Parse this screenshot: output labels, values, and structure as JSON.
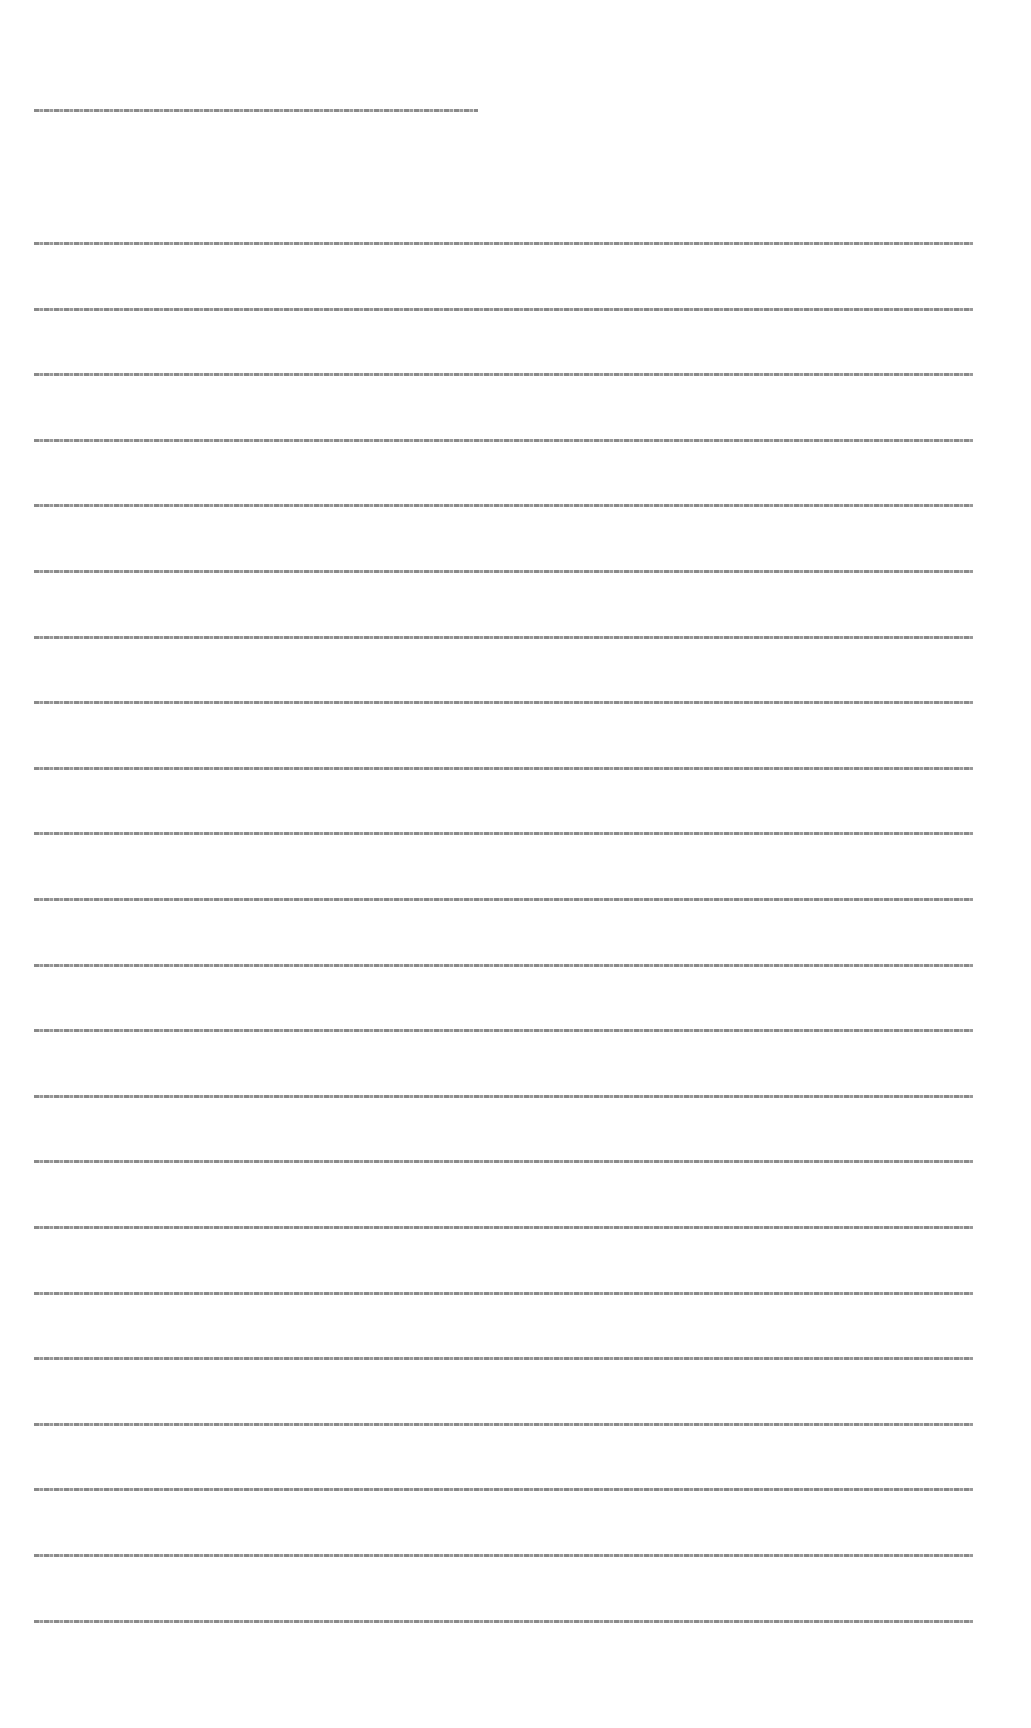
{
  "document": {
    "legibility_note": "Text is rendered too small to be legible in the screenshot; content not transcribable.",
    "header_line": "",
    "body_lines": [
      "",
      "",
      "",
      "",
      "",
      "",
      "",
      "",
      "",
      "",
      "",
      "",
      "",
      "",
      "",
      "",
      "",
      "",
      "",
      "",
      "",
      ""
    ]
  }
}
